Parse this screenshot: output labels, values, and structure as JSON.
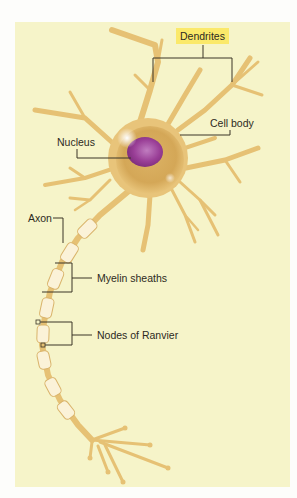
{
  "figure": {
    "colors": {
      "page_background": "#fdfdfb",
      "panel_background": "#f6f4c9",
      "neuron_fill": "#e8c47a",
      "neuron_shadow": "#c89a48",
      "cell_body_inner": "#d9ae5e",
      "nucleus": "#9a3f97",
      "myelin": "#fbf2d8",
      "leader_line": "#3a3426",
      "highlight_label": "#fbe96a"
    },
    "labels": {
      "dendrites": "Dendrites",
      "cell_body": "Cell body",
      "nucleus": "Nucleus",
      "axon": "Axon",
      "myelin_sheaths": "Myelin sheaths",
      "nodes_of_ranvier": "Nodes of Ranvier"
    }
  }
}
